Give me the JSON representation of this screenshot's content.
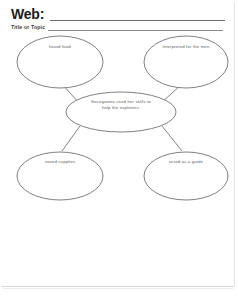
{
  "page": {
    "title_label": "Web:",
    "subtitle_label": "Title or Topic",
    "ink_color": "#5d5d5d",
    "rule_color": "#6e6e6e",
    "background": "#ffffff"
  },
  "diagram": {
    "type": "web-cluster-organizer",
    "center": {
      "id": "center-node",
      "text": "Sacagawea used her skills to\nhelp the explorers."
    },
    "nodes": [
      {
        "id": "node-top-left",
        "position": "top-left",
        "text": "found food"
      },
      {
        "id": "node-top-right",
        "position": "top-right",
        "text": "interpreted for the men"
      },
      {
        "id": "node-bottom-left",
        "position": "bottom-left",
        "text": "saved supplies"
      },
      {
        "id": "node-bottom-right",
        "position": "bottom-right",
        "text": "acted as a guide"
      }
    ],
    "connectors": 4
  }
}
